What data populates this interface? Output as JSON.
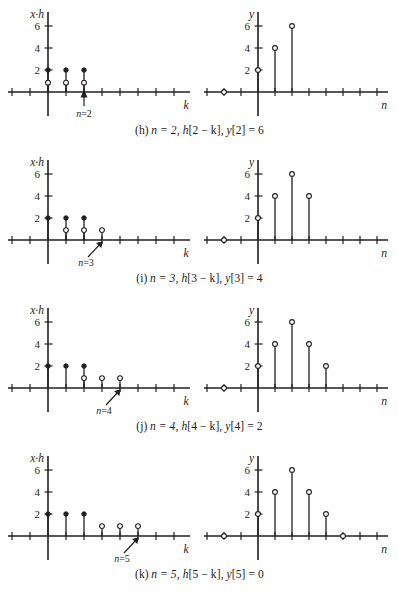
{
  "figure": {
    "axis_labels": {
      "left_y": "x·h",
      "left_x": "k",
      "right_y": "y",
      "right_x": "n"
    },
    "y_ticks": [
      2,
      4,
      6
    ]
  },
  "panels": [
    {
      "id": "h",
      "caption": "(h) n = 2, h[2 − k], y[2] = 6",
      "caption_parts": {
        "letter": "(h)",
        "n_expr": "n = 2,",
        "h_expr": "h[2 − k],",
        "y_expr": "y[2] = 6"
      },
      "marker_label": "n=2",
      "marker_k": 2,
      "left": {
        "ylabel": "x·h",
        "xlabel": "k",
        "filled": [
          {
            "k": 0,
            "v": 2
          },
          {
            "k": 1,
            "v": 2
          },
          {
            "k": 2,
            "v": 2
          }
        ],
        "open": [
          {
            "k": 0,
            "v": 0.85
          },
          {
            "k": 1,
            "v": 0.85
          },
          {
            "k": 2,
            "v": 0.85
          }
        ]
      },
      "right": {
        "ylabel": "y",
        "xlabel": "n",
        "stems": [
          {
            "n": 0,
            "v": 2
          },
          {
            "n": 1,
            "v": 4
          },
          {
            "n": 2,
            "v": 6
          }
        ],
        "zeros": [
          -2
        ]
      }
    },
    {
      "id": "i",
      "caption": "(i) n = 3, h[3 − k], y[3] = 4",
      "caption_parts": {
        "letter": "(i)",
        "n_expr": "n = 3,",
        "h_expr": "h[3 − k],",
        "y_expr": "y[3] = 4"
      },
      "marker_label": "n=3",
      "marker_k": 3,
      "left": {
        "ylabel": "x·h",
        "xlabel": "k",
        "filled": [
          {
            "k": 0,
            "v": 2
          },
          {
            "k": 1,
            "v": 2
          },
          {
            "k": 2,
            "v": 2
          }
        ],
        "open": [
          {
            "k": 1,
            "v": 0.9
          },
          {
            "k": 2,
            "v": 0.9
          },
          {
            "k": 3,
            "v": 0.9
          }
        ]
      },
      "right": {
        "ylabel": "y",
        "xlabel": "n",
        "stems": [
          {
            "n": 0,
            "v": 2
          },
          {
            "n": 1,
            "v": 4
          },
          {
            "n": 2,
            "v": 6
          },
          {
            "n": 3,
            "v": 4
          }
        ],
        "zeros": [
          -2
        ]
      }
    },
    {
      "id": "j",
      "caption": "(j) n = 4, h[4 − k], y[4] = 2",
      "caption_parts": {
        "letter": "(j)",
        "n_expr": "n = 4,",
        "h_expr": "h[4 − k],",
        "y_expr": "y[4] = 2"
      },
      "marker_label": "n=4",
      "marker_k": 4,
      "left": {
        "ylabel": "x·h",
        "xlabel": "k",
        "filled": [
          {
            "k": 0,
            "v": 2
          },
          {
            "k": 1,
            "v": 2
          },
          {
            "k": 2,
            "v": 2
          }
        ],
        "open": [
          {
            "k": 2,
            "v": 0.9
          },
          {
            "k": 3,
            "v": 0.9
          },
          {
            "k": 4,
            "v": 0.9
          }
        ]
      },
      "right": {
        "ylabel": "y",
        "xlabel": "n",
        "stems": [
          {
            "n": 0,
            "v": 2
          },
          {
            "n": 1,
            "v": 4
          },
          {
            "n": 2,
            "v": 6
          },
          {
            "n": 3,
            "v": 4
          },
          {
            "n": 4,
            "v": 2
          }
        ],
        "zeros": [
          -2
        ]
      }
    },
    {
      "id": "k",
      "caption": "(k) n = 5, h[5 − k], y[5] = 0",
      "caption_parts": {
        "letter": "(k)",
        "n_expr": "n = 5,",
        "h_expr": "h[5 − k],",
        "y_expr": "y[5] = 0"
      },
      "marker_label": "n=5",
      "marker_k": 5,
      "left": {
        "ylabel": "x·h",
        "xlabel": "k",
        "filled": [
          {
            "k": 0,
            "v": 2
          },
          {
            "k": 1,
            "v": 2
          },
          {
            "k": 2,
            "v": 2
          }
        ],
        "open": [
          {
            "k": 3,
            "v": 0.9
          },
          {
            "k": 4,
            "v": 0.9
          },
          {
            "k": 5,
            "v": 0.9
          }
        ]
      },
      "right": {
        "ylabel": "y",
        "xlabel": "n",
        "stems": [
          {
            "n": 0,
            "v": 2
          },
          {
            "n": 1,
            "v": 4
          },
          {
            "n": 2,
            "v": 6
          },
          {
            "n": 3,
            "v": 4
          },
          {
            "n": 4,
            "v": 2
          }
        ],
        "zeros": [
          -2,
          5
        ]
      }
    }
  ],
  "chart_data": {
    "type": "line",
    "xlabel": "k / n",
    "ylabel": "x·h / y",
    "ylim": [
      0,
      7
    ],
    "xlim": [
      -4,
      7
    ],
    "y_ticks": [
      2,
      4,
      6
    ],
    "grid": false,
    "legend": "none",
    "series": [
      {
        "name": "(h) left x·h filled",
        "x": [
          0,
          1,
          2
        ],
        "values": [
          2,
          2,
          2
        ]
      },
      {
        "name": "(h) left overlap open",
        "x": [
          0,
          1,
          2
        ],
        "values": [
          0.85,
          0.85,
          0.85
        ]
      },
      {
        "name": "(h) right y[n]",
        "x": [
          -2,
          0,
          1,
          2
        ],
        "values": [
          0,
          2,
          4,
          6
        ]
      },
      {
        "name": "(i) left x·h filled",
        "x": [
          0,
          1,
          2
        ],
        "values": [
          2,
          2,
          2
        ]
      },
      {
        "name": "(i) left overlap open",
        "x": [
          1,
          2,
          3
        ],
        "values": [
          0.9,
          0.9,
          0.9
        ]
      },
      {
        "name": "(i) right y[n]",
        "x": [
          -2,
          0,
          1,
          2,
          3
        ],
        "values": [
          0,
          2,
          4,
          6,
          4
        ]
      },
      {
        "name": "(j) left x·h filled",
        "x": [
          0,
          1,
          2
        ],
        "values": [
          2,
          2,
          2
        ]
      },
      {
        "name": "(j) left overlap open",
        "x": [
          2,
          3,
          4
        ],
        "values": [
          0.9,
          0.9,
          0.9
        ]
      },
      {
        "name": "(j) right y[n]",
        "x": [
          -2,
          0,
          1,
          2,
          3,
          4
        ],
        "values": [
          0,
          2,
          4,
          6,
          4,
          2
        ]
      },
      {
        "name": "(k) left x·h filled",
        "x": [
          0,
          1,
          2
        ],
        "values": [
          2,
          2,
          2
        ]
      },
      {
        "name": "(k) left overlap open",
        "x": [
          3,
          4,
          5
        ],
        "values": [
          0.9,
          0.9,
          0.9
        ]
      },
      {
        "name": "(k) right y[n]",
        "x": [
          -2,
          0,
          1,
          2,
          3,
          4,
          5
        ],
        "values": [
          0,
          2,
          4,
          6,
          4,
          2,
          0
        ]
      }
    ]
  }
}
